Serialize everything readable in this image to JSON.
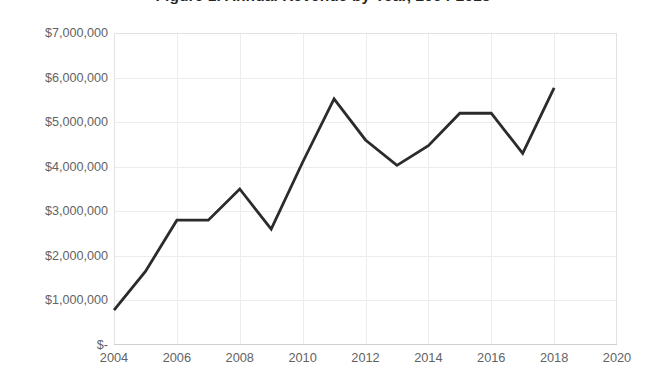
{
  "chart": {
    "title": "Figure 1. Annual Revenue by Year, 2004-2018",
    "line_color": "#2b2b2b",
    "grid_color": "#ececec",
    "frame_color": "#e2e2e2",
    "axis_text_color": "#636363",
    "background": "#ffffff"
  },
  "chart_data": {
    "type": "line",
    "title": "Figure 1. Annual Revenue by Year, 2004-2018",
    "xlabel": "",
    "ylabel": "",
    "xlim": [
      2004,
      2020
    ],
    "ylim": [
      0,
      7000000
    ],
    "grid": true,
    "legend": false,
    "x_ticks": [
      "2004",
      "2006",
      "2008",
      "2010",
      "2012",
      "2014",
      "2016",
      "2018",
      "2020"
    ],
    "x_tick_values": [
      2004,
      2006,
      2008,
      2010,
      2012,
      2014,
      2016,
      2018,
      2020
    ],
    "y_ticks": [
      "$-",
      "$1,000,000",
      "$2,000,000",
      "$3,000,000",
      "$4,000,000",
      "$5,000,000",
      "$6,000,000",
      "$7,000,000"
    ],
    "y_tick_values": [
      0,
      1000000,
      2000000,
      3000000,
      4000000,
      5000000,
      6000000,
      7000000
    ],
    "x": [
      2004,
      2005,
      2006,
      2007,
      2008,
      2009,
      2010,
      2011,
      2012,
      2013,
      2014,
      2015,
      2016,
      2017,
      2018
    ],
    "series": [
      {
        "name": "Revenue",
        "values": [
          780000,
          1650000,
          2800000,
          2800000,
          3500000,
          2600000,
          4100000,
          5520000,
          4600000,
          4030000,
          4470000,
          5200000,
          5200000,
          4300000,
          5770000
        ]
      }
    ]
  }
}
